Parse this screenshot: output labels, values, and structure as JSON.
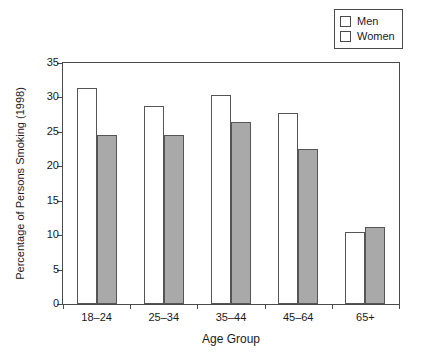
{
  "chart_data": {
    "type": "bar",
    "title": "",
    "subtitle": "",
    "xlabel": "Age Group",
    "ylabel": "Percentage of Persons Smoking (1998)",
    "categories": [
      "18–24",
      "25–34",
      "35–44",
      "45–64",
      "65+"
    ],
    "series": [
      {
        "name": "Men",
        "values": [
          31.3,
          28.7,
          30.3,
          27.7,
          10.4
        ],
        "color": "#ffffff"
      },
      {
        "name": "Women",
        "values": [
          24.5,
          24.6,
          26.4,
          22.5,
          11.2
        ],
        "color": "#a9a9a9"
      }
    ],
    "ylim": [
      0,
      35
    ],
    "yticks": [
      0,
      5,
      10,
      15,
      20,
      25,
      30,
      35
    ],
    "ytick_labels": [
      "0",
      "5",
      "10",
      "15",
      "20",
      "25",
      "30",
      "35"
    ],
    "grid": false,
    "legend_position": "top-right",
    "legend_entries": [
      {
        "label": "Men",
        "swatch": "white-square-outline"
      },
      {
        "label": "Women",
        "swatch": "gray-square-outline"
      }
    ]
  }
}
